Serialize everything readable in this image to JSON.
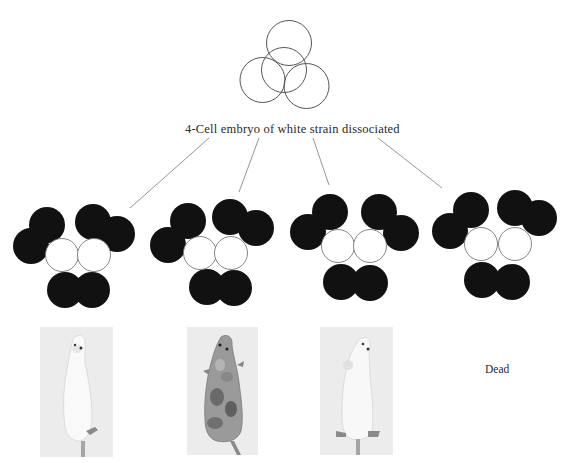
{
  "figure": {
    "top_embryo": {
      "label": "4-Cell embryo of white strain dissociated",
      "cells": [
        {
          "cx": 289,
          "cy": 43,
          "r": 22.5
        },
        {
          "cx": 284,
          "cy": 70,
          "r": 22.5
        },
        {
          "cx": 262.5,
          "cy": 80,
          "r": 22.5
        },
        {
          "cx": 306.5,
          "cy": 86,
          "r": 22.5
        }
      ],
      "stroke_color": "#555555"
    },
    "connector_lines": [
      {
        "x1": 209,
        "y1": 138,
        "x2": 130,
        "y2": 208
      },
      {
        "x1": 259,
        "y1": 138,
        "x2": 239,
        "y2": 192
      },
      {
        "x1": 313,
        "y1": 138,
        "x2": 329,
        "y2": 185
      },
      {
        "x1": 378,
        "y1": 138,
        "x2": 442,
        "y2": 188
      }
    ],
    "aggregates": [
      {
        "name": "aggregate-1",
        "black_cells": [
          {
            "cx": 47,
            "cy": 225
          },
          {
            "cx": 31,
            "cy": 246
          },
          {
            "cx": 93,
            "cy": 222
          },
          {
            "cx": 117,
            "cy": 234
          },
          {
            "cx": 65,
            "cy": 290
          },
          {
            "cx": 92,
            "cy": 290
          }
        ],
        "white_cells": [
          {
            "cx": 62,
            "cy": 255
          },
          {
            "cx": 94,
            "cy": 255
          }
        ]
      },
      {
        "name": "aggregate-2",
        "black_cells": [
          {
            "cx": 188,
            "cy": 221
          },
          {
            "cx": 168,
            "cy": 245
          },
          {
            "cx": 230,
            "cy": 217
          },
          {
            "cx": 256,
            "cy": 228
          },
          {
            "cx": 207,
            "cy": 287
          },
          {
            "cx": 234,
            "cy": 288
          }
        ],
        "white_cells": [
          {
            "cx": 200,
            "cy": 253
          },
          {
            "cx": 231,
            "cy": 253
          }
        ]
      },
      {
        "name": "aggregate-3",
        "black_cells": [
          {
            "cx": 330,
            "cy": 212
          },
          {
            "cx": 308,
            "cy": 232
          },
          {
            "cx": 379,
            "cy": 212
          },
          {
            "cx": 401,
            "cy": 233
          },
          {
            "cx": 341,
            "cy": 282
          },
          {
            "cx": 370,
            "cy": 283
          }
        ],
        "white_cells": [
          {
            "cx": 338,
            "cy": 246
          },
          {
            "cx": 370,
            "cy": 246
          }
        ]
      },
      {
        "name": "aggregate-4",
        "black_cells": [
          {
            "cx": 471,
            "cy": 210
          },
          {
            "cx": 450,
            "cy": 231
          },
          {
            "cx": 515,
            "cy": 208
          },
          {
            "cx": 539,
            "cy": 218
          },
          {
            "cx": 482,
            "cy": 280
          },
          {
            "cx": 512,
            "cy": 282
          }
        ],
        "white_cells": [
          {
            "cx": 481,
            "cy": 244
          },
          {
            "cx": 515,
            "cy": 244
          }
        ]
      }
    ],
    "cell_radius_black": 18,
    "cell_radius_white": 16.5,
    "colors": {
      "black_cell": "#111111",
      "white_cell_fill": "#ffffff",
      "white_cell_stroke": "#777777",
      "line": "#8a8a8a",
      "photo_bg": "#ececec"
    },
    "outcomes": [
      {
        "type": "photo",
        "description": "white mouse",
        "coat": "white",
        "x": 40,
        "y": 327,
        "w": 73,
        "h": 130
      },
      {
        "type": "photo",
        "description": "chimeric mottled mouse",
        "coat": "mottled",
        "x": 187,
        "y": 327,
        "w": 71,
        "h": 128
      },
      {
        "type": "photo",
        "description": "white mouse",
        "coat": "white",
        "x": 320,
        "y": 327,
        "w": 73,
        "h": 128
      },
      {
        "type": "text",
        "label": "Dead"
      }
    ]
  }
}
